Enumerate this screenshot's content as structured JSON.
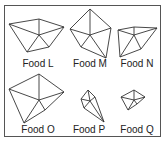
{
  "figure": {
    "stroke_color": "#333333",
    "items": [
      {
        "label": "Food L",
        "center": [
          39,
          35
        ],
        "vertices": [
          [
            9,
            24
          ],
          [
            39,
            19
          ],
          [
            64,
            27
          ],
          [
            49,
            47
          ],
          [
            27,
            52
          ]
        ],
        "label_pos": [
          38,
          58
        ]
      },
      {
        "label": "Food M",
        "center": [
          90,
          35
        ],
        "vertices": [
          [
            90,
            9
          ],
          [
            111,
            28
          ],
          [
            106,
            58
          ],
          [
            81,
            47
          ],
          [
            70,
            29
          ]
        ],
        "label_pos": [
          90,
          58
        ]
      },
      {
        "label": "Food N",
        "center": [
          134,
          35
        ],
        "vertices": [
          [
            118,
            30
          ],
          [
            134,
            27
          ],
          [
            157,
            28
          ],
          [
            141,
            49
          ],
          [
            120,
            57
          ]
        ],
        "label_pos": [
          137,
          58
        ]
      },
      {
        "label": "Food O",
        "center": [
          39,
          100
        ],
        "vertices": [
          [
            39,
            74
          ],
          [
            64,
            92
          ],
          [
            45,
            110
          ],
          [
            24,
            123
          ],
          [
            9,
            89
          ]
        ],
        "label_pos": [
          38,
          124
        ]
      },
      {
        "label": "Food P",
        "center": [
          90,
          101
        ],
        "vertices": [
          [
            88,
            90
          ],
          [
            95,
            97
          ],
          [
            104,
            122
          ],
          [
            84,
            108
          ],
          [
            81,
            99
          ]
        ],
        "label_pos": [
          89,
          124
        ]
      },
      {
        "label": "Food Q",
        "center": [
          134,
          100
        ],
        "vertices": [
          [
            134,
            90
          ],
          [
            145,
            97
          ],
          [
            137,
            104
          ],
          [
            128,
            110
          ],
          [
            121,
            97
          ]
        ],
        "label_pos": [
          137,
          124
        ]
      }
    ]
  }
}
